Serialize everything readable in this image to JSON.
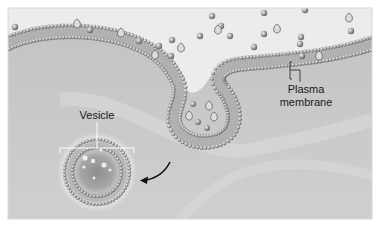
{
  "diagram": {
    "labels": {
      "vesicle": "Vesicle",
      "membrane_line1": "Plasma",
      "membrane_line2": "membrane"
    },
    "colors": {
      "extracellular": "#e9e9e9",
      "cytoplasm": "#c9c9c9",
      "lipid_head": "#9a9a9a",
      "lipid_head_edge": "#6e6e6e",
      "molecule": "#8c8c8c",
      "arrow": "#111111"
    },
    "molecules": {
      "round_count": 18,
      "drop_count": 8,
      "inside_pit_count": 6,
      "inside_vesicle_count": 7
    }
  }
}
